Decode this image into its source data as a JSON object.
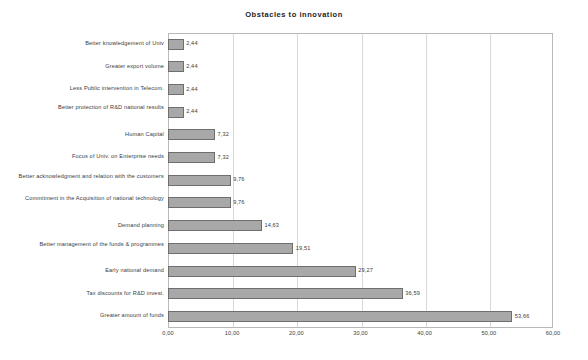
{
  "chart_data": {
    "type": "bar",
    "orientation": "horizontal",
    "title": "Obstacles to innovation",
    "xlabel": "",
    "ylabel": "",
    "xlim": [
      0,
      60
    ],
    "xticks": [
      0,
      10,
      20,
      30,
      40,
      50,
      60
    ],
    "xtick_labels": [
      "0,00",
      "10,00",
      "20,00",
      "30,00",
      "40,00",
      "50,00",
      "60,00"
    ],
    "grid": true,
    "legend": false,
    "decimal_separator": ",",
    "bar_color": "#a8a8a8",
    "bar_border_color": "#6e6e6e",
    "categories": [
      "Better knowledgement of Univ",
      "Greater export volume",
      "Less Public intervention in Telecom.",
      "Better protection of R&D national results",
      "Human Capital",
      "Focus of Univ. on Enterprise needs",
      "Better acknowledgment and relation with the customers",
      "Commitment in the Acquisition of national technology",
      "Demand planning",
      "Better management of the funds & programmes",
      "Early national demand",
      "Tax discounts for R&D invest.",
      "Greater amount of funds"
    ],
    "values": [
      2.44,
      2.44,
      2.44,
      2.44,
      7.32,
      7.32,
      9.76,
      9.76,
      14.63,
      19.51,
      29.27,
      36.59,
      53.66
    ],
    "value_labels": [
      "2,44",
      "2,44",
      "2,44",
      "2,44",
      "7,32",
      "7,32",
      "9,76",
      "9,76",
      "14,63",
      "19,51",
      "29,27",
      "36,59",
      "53,66"
    ]
  }
}
